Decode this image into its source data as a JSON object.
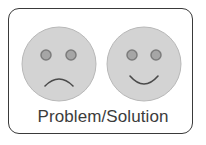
{
  "caption": "Problem/Solution",
  "icons": {
    "left": "sad-face-icon",
    "right": "happy-face-icon"
  },
  "colors": {
    "face_fill": "#d3d3d3",
    "face_stroke": "#b8b8b8",
    "eye_fill": "#a6a6a6",
    "eye_stroke": "#7c7c7c",
    "mouth_stroke": "#4a4a4a",
    "border": "#3a3a3a",
    "text": "#3c3c3c"
  }
}
